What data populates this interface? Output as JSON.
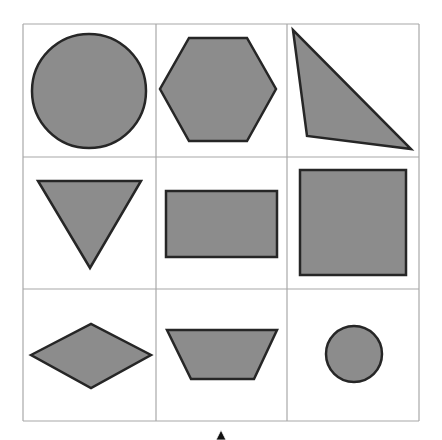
{
  "colors": {
    "background": "#ffffff",
    "grid_line": "#a8a8a8",
    "shape_fill": "#8c8c8c",
    "shape_stroke": "#262626"
  },
  "grid": {
    "rows": 3,
    "cols": 3,
    "x_lines": [
      23,
      156,
      287,
      419
    ],
    "y_lines": [
      24,
      157,
      289,
      421
    ]
  },
  "shapes": [
    {
      "name": "circle-large",
      "type": "circle",
      "cx": 89,
      "cy": 91,
      "r": 57
    },
    {
      "name": "hexagon",
      "type": "polygon",
      "points": "189,38 247,38 276,89 247,141 189,141 160,89"
    },
    {
      "name": "right-triangle",
      "type": "polygon",
      "points": "293,30 307,136 411,149"
    },
    {
      "name": "inverted-triangle",
      "type": "polygon",
      "points": "38,181 141,181 90,268"
    },
    {
      "name": "rectangle",
      "type": "polygon",
      "points": "166,191 277,191 277,257 166,257"
    },
    {
      "name": "square",
      "type": "polygon",
      "points": "300,170 406,170 406,275 300,275"
    },
    {
      "name": "diamond",
      "type": "polygon",
      "points": "31,355 91,324 151,355 91,388"
    },
    {
      "name": "trapezoid",
      "type": "polygon",
      "points": "167,330 277,330 254,379 191,379"
    },
    {
      "name": "circle-small",
      "type": "circle",
      "cx": 354,
      "cy": 354,
      "r": 28
    }
  ],
  "cursor": {
    "x": 221,
    "y": 438
  }
}
